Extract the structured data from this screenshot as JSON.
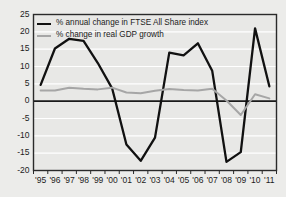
{
  "chart_data": {
    "type": "line",
    "title": "",
    "xlabel": "",
    "ylabel": "",
    "grid": true,
    "legend_position": "top-left",
    "categories": [
      "'95",
      "'96",
      "'97",
      "'98",
      "'99",
      "'00",
      "'01",
      "'02",
      "'03",
      "'04",
      "'05",
      "'06",
      "'07",
      "'08",
      "'09",
      "'10",
      "'11"
    ],
    "ylim": [
      -20,
      25
    ],
    "yticks": [
      25,
      20,
      15,
      10,
      5,
      0,
      -5,
      -10,
      -15,
      -20
    ],
    "series": [
      {
        "name": "% annual change in FTSE All Share index",
        "color": "#111111",
        "values": [
          4.7,
          15.2,
          18.0,
          17.4,
          11.0,
          3.7,
          -12.5,
          -17.2,
          -10.5,
          14.0,
          13.2,
          16.7,
          8.8,
          -17.5,
          -14.7,
          21.0,
          4.3
        ]
      },
      {
        "name": "% change in real GDP growth",
        "color": "#a6a6a6",
        "values": [
          3.1,
          3.1,
          3.9,
          3.6,
          3.4,
          3.9,
          2.5,
          2.3,
          3.0,
          3.5,
          3.2,
          3.1,
          3.6,
          0.2,
          -4.0,
          2.0,
          0.8
        ]
      }
    ],
    "axis_zero_line": 0
  },
  "legend": {
    "items": [
      {
        "label": "% annual change in FTSE All Share index"
      },
      {
        "label": "% change in real GDP growth"
      }
    ]
  }
}
